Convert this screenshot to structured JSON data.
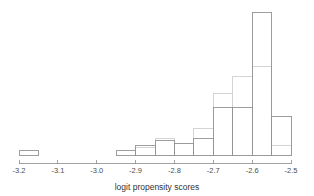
{
  "chart_data": {
    "type": "bar",
    "title": "",
    "subtitle": "",
    "xlabel": "logit propensity scores",
    "ylabel": "",
    "xlim": [
      -3.2,
      -2.5
    ],
    "ylim": [
      0,
      60
    ],
    "grid": false,
    "legend_position": "none",
    "bin_width": 0.05,
    "bin_edges": [
      -3.2,
      -3.15,
      -3.1,
      -3.05,
      -3.0,
      -2.95,
      -2.9,
      -2.85,
      -2.8,
      -2.75,
      -2.7,
      -2.65,
      -2.6,
      -2.55,
      -2.5
    ],
    "x_tick_labels": [
      "-3.2",
      "-3.1",
      "-3.0",
      "-2.9",
      "-2.8",
      "-2.7",
      "-2.6",
      "-2.5"
    ],
    "x_tick_values": [
      -3.2,
      -3.1,
      -3.0,
      -2.9,
      -2.8,
      -2.7,
      -2.6,
      -2.5
    ],
    "categories": [
      "-3.20",
      "-3.15",
      "-3.10",
      "-3.05",
      "-3.00",
      "-2.95",
      "-2.90",
      "-2.85",
      "-2.80",
      "-2.75",
      "-2.70",
      "-2.65",
      "-2.60",
      "-2.55"
    ],
    "series": [
      {
        "name": "treated",
        "color": "#949494",
        "values": [
          2,
          0,
          0,
          0,
          0,
          2,
          4,
          6,
          5,
          7,
          20,
          20,
          60,
          16
        ]
      },
      {
        "name": "control",
        "color": "#cfcfcf",
        "values": [
          0,
          0,
          0,
          0,
          0,
          0,
          3,
          7,
          5,
          11,
          26,
          33,
          37,
          4
        ]
      }
    ]
  },
  "axis": {
    "x_title": "logit propensity scores"
  }
}
